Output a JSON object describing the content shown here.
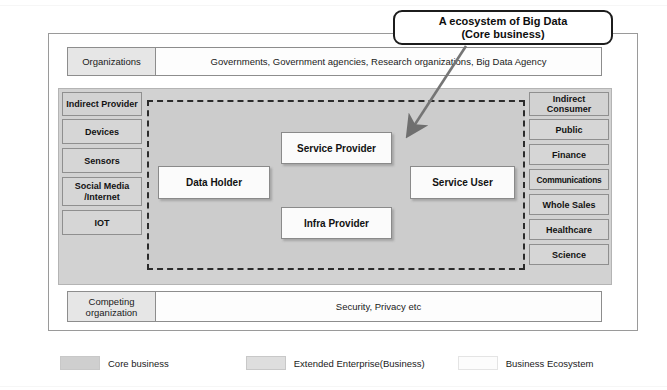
{
  "diagram": {
    "callout": {
      "line1": "A ecosystem of Big Data",
      "line2": "(Core business)"
    },
    "organizations_band": {
      "key": "Organizations",
      "value": "Governments, Government agencies, Research organizations, Big Data Agency"
    },
    "competing_band": {
      "key": "Competing organization",
      "value": "Security, Privacy  etc"
    },
    "indirect_provider": {
      "header": "Indirect Provider",
      "items": [
        {
          "label": "Devices"
        },
        {
          "label": "Sensors"
        },
        {
          "label": "Social Media /Internet"
        },
        {
          "label": "IOT"
        }
      ]
    },
    "indirect_consumer": {
      "header": "Indirect Consumer",
      "items": [
        {
          "label": "Public"
        },
        {
          "label": "Finance"
        },
        {
          "label": "Communications"
        },
        {
          "label": "Whole Sales"
        },
        {
          "label": "Healthcare"
        },
        {
          "label": "Science"
        }
      ]
    },
    "actors": [
      {
        "label": "Data Holder"
      },
      {
        "label": "Service Provider"
      },
      {
        "label": "Infra Provider"
      },
      {
        "label": "Service User"
      }
    ],
    "legend": [
      {
        "label": "Core business",
        "color": "#cccccc"
      },
      {
        "label": "Extended  Enterprise(Business)",
        "color": "#dcdcdc"
      },
      {
        "label": "Business Ecosystem",
        "color": "#fbfbfb"
      }
    ],
    "colors": {
      "core_business": "#cccccc",
      "extended_enterprise": "#d2d2d2",
      "business_ecosystem": "#ffffff",
      "frame_border": "#9a9a9a",
      "dashed_border": "#2b2b2b",
      "text": "#111111"
    }
  }
}
